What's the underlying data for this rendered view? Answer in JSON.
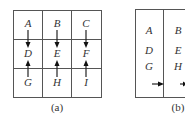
{
  "panel_a": {
    "caption": "(a)",
    "cells": [
      [
        "A",
        "B",
        "C"
      ],
      [
        "D",
        "E",
        "F"
      ],
      [
        "G",
        "H",
        "I"
      ]
    ],
    "arrows": [
      {
        "from": "A",
        "to": "D",
        "direction": "down"
      },
      {
        "from": "B",
        "to": "E",
        "direction": "down"
      },
      {
        "from": "C",
        "to": "F",
        "direction": "down"
      },
      {
        "from": "G",
        "to": "D",
        "direction": "up"
      },
      {
        "from": "H",
        "to": "E",
        "direction": "up"
      },
      {
        "from": "I",
        "to": "F",
        "direction": "up"
      }
    ]
  },
  "panel_b": {
    "caption": "(b)",
    "columns": [
      [
        "A",
        "D",
        "G"
      ],
      [
        "B",
        "E",
        "H"
      ]
    ],
    "arrows": [
      {
        "from": "column-1",
        "to": "column-2",
        "direction": "right"
      }
    ]
  }
}
